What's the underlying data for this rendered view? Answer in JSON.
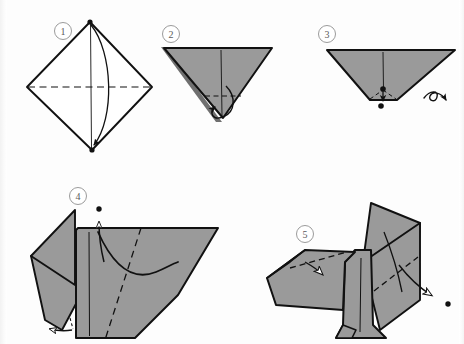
{
  "document": {
    "kind": "origami-instruction-diagram",
    "title": "Origami folding sequence",
    "step_count": 5
  },
  "palette": {
    "paper_front": "#9a9a9a",
    "paper_shadow": "#7e7e7e",
    "paper_back": "#ffffff",
    "ink": "#111111",
    "badge_stroke": "#9b9b9b",
    "badge_text": "#5a5a5a",
    "background": "#fdfdfd"
  },
  "steps": [
    {
      "number": "1",
      "badge_label": "1",
      "caption": "Square sheet placed as a diamond, white side up.",
      "shape": "diamond-outline",
      "fill": "white",
      "marks": {
        "vertical_crease": "solid",
        "horizontal_crease": "dashed",
        "arrow": "fold-top-point-to-bottom-point",
        "vertex_dots": 2
      }
    },
    {
      "number": "2",
      "badge_label": "2",
      "caption": "Folded in half downward into a triangle.",
      "shape": "inverted-triangle",
      "fill": "gray",
      "marks": {
        "vertical_crease": "solid",
        "horizontal_crease": "dashed",
        "arrow": "small-curl-at-bottom-tip"
      }
    },
    {
      "number": "3",
      "badge_label": "3",
      "caption": "Bottom tip folded up; turn the model over.",
      "shape": "triangle-with-flat-base",
      "fill": "gray",
      "marks": {
        "vertical_crease": "solid",
        "fold_lines": "dashed",
        "arrow": "turn-over-curl",
        "reference_dots": 2
      }
    },
    {
      "number": "4",
      "badge_label": "4",
      "caption": "Body shape with diagonal valley fold; lift the flap upward.",
      "shape": "body-blank",
      "fill": "gray",
      "marks": {
        "diagonal_crease": "dashed",
        "vertical_crease": "solid",
        "arrow_up": "lift-flap",
        "arrow_left": "small-tuck",
        "reference_dot": 1
      }
    },
    {
      "number": "5",
      "badge_label": "5",
      "caption": "Completed dog-like figure; shape head and tail.",
      "shape": "animal-figure",
      "fill": "gray",
      "marks": {
        "head_crease": "dashed",
        "tail_crease": "dashed",
        "arrow_head": "hollow-arrowhead-into-head",
        "arrow_tail": "hollow-arrow-out-to-right",
        "reference_dot": 1
      }
    }
  ],
  "badges": [
    {
      "label": "1",
      "cx": 63,
      "cy": 31
    },
    {
      "label": "2",
      "cx": 171,
      "cy": 34
    },
    {
      "label": "3",
      "cx": 327,
      "cy": 34
    },
    {
      "label": "4",
      "cx": 78,
      "cy": 196
    },
    {
      "label": "5",
      "cx": 305,
      "cy": 234
    }
  ]
}
